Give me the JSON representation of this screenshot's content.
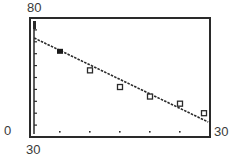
{
  "chart_data": {
    "type": "scatter",
    "title": "",
    "xlabel": "",
    "ylabel": "",
    "xlim": [
      0,
      30
    ],
    "ylim": [
      30,
      80
    ],
    "window_labels": {
      "y_max": "80",
      "y_min": "30",
      "x_min": "0",
      "x_max": "30"
    },
    "grid": false,
    "legend": null,
    "x_tick_step": 5,
    "y_tick_step": 5,
    "series": [
      {
        "name": "data",
        "marker": "square",
        "points": [
          [
            5,
            66
          ],
          [
            10,
            58
          ],
          [
            15,
            51
          ],
          [
            20,
            47
          ],
          [
            25,
            44
          ],
          [
            29,
            40
          ]
        ]
      }
    ],
    "regression_line": {
      "style": "dashed",
      "slope": -1.19,
      "intercept": 71.6,
      "from": [
        0.7,
        71.6
      ],
      "to": [
        29.7,
        36.3
      ]
    }
  }
}
